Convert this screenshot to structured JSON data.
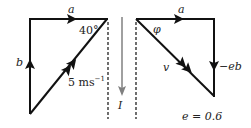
{
  "diagram": {
    "left_triangle": {
      "labels": {
        "top": "a",
        "side": "b",
        "angle": "40°",
        "hyp_value": "5 ms",
        "hyp_unit_exp": "−1"
      }
    },
    "impulse": {
      "label": "I"
    },
    "right_triangle": {
      "labels": {
        "top": "a",
        "angle": "φ",
        "hyp": "v",
        "side": "−eb"
      }
    },
    "note": "e = 0.6",
    "colors": {
      "line": "#111111",
      "impulse_arrow": "#808080",
      "dashed": "#222222"
    }
  }
}
